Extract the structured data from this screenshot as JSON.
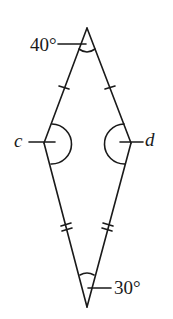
{
  "diagram": {
    "shape": "kite",
    "stroke_color": "#1a1a1a",
    "background": "#ffffff",
    "vertices": {
      "top": {
        "x": 87,
        "y": 28
      },
      "left": {
        "x": 44,
        "y": 143
      },
      "right": {
        "x": 131,
        "y": 143
      },
      "bottom": {
        "x": 87,
        "y": 307
      }
    },
    "labels": {
      "top_angle": "40°",
      "left_angle": "c",
      "right_angle": "d",
      "bottom_angle": "30°"
    },
    "tick_marks": {
      "upper_sides": "single",
      "lower_sides": "double"
    }
  }
}
